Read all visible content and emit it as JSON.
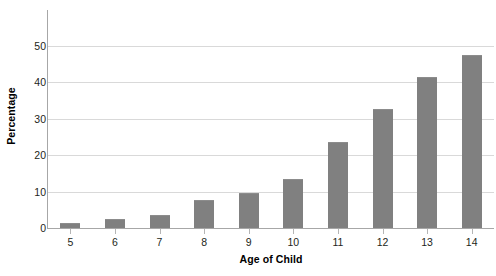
{
  "chart_data": {
    "type": "bar",
    "title": "",
    "xlabel": "Age of Child",
    "ylabel": "Percentage",
    "categories": [
      "5",
      "6",
      "7",
      "8",
      "9",
      "10",
      "11",
      "12",
      "13",
      "14"
    ],
    "values": [
      1.5,
      2.4,
      3.6,
      7.7,
      9.7,
      13.6,
      23.7,
      32.7,
      41.5,
      47.5
    ],
    "ylim": [
      0,
      57
    ],
    "yticks": [
      0,
      10,
      20,
      30,
      40,
      50
    ],
    "ytick_labels": [
      "0",
      "10",
      "20",
      "30",
      "40",
      "50"
    ],
    "grid": true,
    "legend": "none",
    "series": [
      {
        "name": "Percentage",
        "color": "#808080",
        "values": [
          1.5,
          2.4,
          3.6,
          7.7,
          9.7,
          13.6,
          23.7,
          32.7,
          41.5,
          47.5
        ]
      }
    ],
    "colors": {
      "bar": "#808080",
      "gridline": "#d9d9d9",
      "axis": "#a7a7a7",
      "text": "#231f20",
      "background": "#ffffff"
    }
  }
}
